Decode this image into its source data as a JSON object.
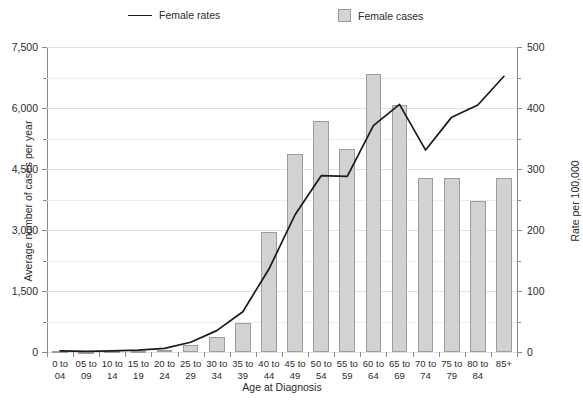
{
  "legend": {
    "rates_label": "Female rates",
    "cases_label": "Female cases",
    "line_color": "#1a1a1a",
    "bar_fill": "#d2d2d2",
    "bar_stroke": "#9d9d9d"
  },
  "axes": {
    "y_left_title": "Average number of cases per year",
    "y_right_title": "Rate per 100,000",
    "x_title": "Age at Diagnosis"
  },
  "chart_data": {
    "type": "bar",
    "title": "",
    "xlabel": "Age at Diagnosis",
    "ylabel": "Average number of cases per year",
    "y2label": "Rate per 100,000",
    "ylim": [
      0,
      7500
    ],
    "y2lim": [
      0,
      500
    ],
    "y_ticks": [
      "0",
      "1,500",
      "3,000",
      "4,500",
      "6,000",
      "7,500"
    ],
    "y_tick_values": [
      0,
      1500,
      3000,
      4500,
      6000,
      7500
    ],
    "y_minor_tick_values": [
      750,
      2250,
      3750,
      5250,
      6750
    ],
    "y2_ticks": [
      "0",
      "100",
      "200",
      "300",
      "400",
      "500"
    ],
    "y2_tick_values": [
      0,
      100,
      200,
      300,
      400,
      500
    ],
    "y2_minor_tick_values": [
      50,
      150,
      250,
      350,
      450
    ],
    "grid": true,
    "legend_position": "top",
    "categories": [
      "0 to 04",
      "05 to 09",
      "10 to 14",
      "15 to 19",
      "20 to 24",
      "25 to 29",
      "30 to 34",
      "35 to 39",
      "40 to 44",
      "45 to 49",
      "50 to 54",
      "55 to 59",
      "60 to 64",
      "65 to 69",
      "70 to 74",
      "75 to 79",
      "80 to 84",
      "85+"
    ],
    "series": [
      {
        "name": "Female cases",
        "type": "bar",
        "axis": "left",
        "values": [
          15,
          12,
          15,
          25,
          60,
          170,
          380,
          720,
          2960,
          4880,
          5680,
          4980,
          6830,
          6080,
          4270,
          4290,
          3720,
          4270
        ]
      },
      {
        "name": "Female rates",
        "type": "line",
        "axis": "right",
        "values": [
          2,
          1,
          2,
          3,
          6,
          16,
          35,
          66,
          136,
          225,
          289,
          288,
          371,
          406,
          331,
          385,
          405,
          452
        ]
      }
    ]
  }
}
